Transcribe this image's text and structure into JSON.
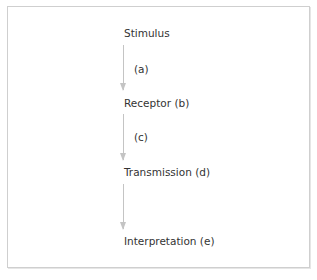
{
  "diagram": {
    "nodes": [
      {
        "id": "stimulus",
        "label": "Stimulus"
      },
      {
        "id": "receptor",
        "label": "Receptor (b)"
      },
      {
        "id": "transmission",
        "label": "Transmission (d)"
      },
      {
        "id": "interpretation",
        "label": "Interpretation (e)"
      }
    ],
    "edges": [
      {
        "from": "stimulus",
        "to": "receptor",
        "label": "(a)"
      },
      {
        "from": "receptor",
        "to": "transmission",
        "label": "(c)"
      },
      {
        "from": "transmission",
        "to": "interpretation",
        "label": ""
      }
    ],
    "colors": {
      "border": "#cfcfcf",
      "arrow": "#c4c4c4",
      "text": "#333333"
    }
  }
}
